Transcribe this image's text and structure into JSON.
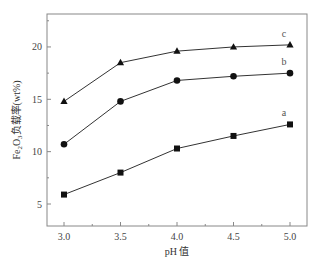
{
  "chart_data": {
    "type": "line",
    "title": "",
    "xlabel": "pH 值",
    "ylabel": "Fe2O3负载率(wt%)",
    "ylabel_parts": {
      "prefix": "Fe",
      "sub1": "2",
      "mid": "O",
      "sub2": "3",
      "suffix": "负载率(wt%)"
    },
    "x": [
      3.0,
      3.5,
      4.0,
      4.5,
      5.0
    ],
    "xlim": [
      2.85,
      5.15
    ],
    "ylim": [
      3,
      23
    ],
    "x_ticks": [
      "3.0",
      "3.5",
      "4.0",
      "4.5",
      "5.0"
    ],
    "y_ticks": [
      "5",
      "10",
      "15",
      "20"
    ],
    "grid": false,
    "legend": "inline labels at right end of each series",
    "series": [
      {
        "name": "a",
        "marker": "square",
        "values": [
          5.9,
          8.0,
          10.3,
          11.5,
          12.6
        ]
      },
      {
        "name": "b",
        "marker": "circle",
        "values": [
          10.7,
          14.8,
          16.8,
          17.2,
          17.5
        ]
      },
      {
        "name": "c",
        "marker": "triangle",
        "values": [
          14.8,
          18.5,
          19.6,
          20.0,
          20.2
        ]
      }
    ]
  },
  "colors": {
    "axis": "#888888",
    "line": "#333333",
    "marker": "#111111"
  }
}
